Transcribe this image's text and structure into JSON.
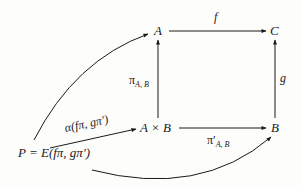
{
  "nodes": {
    "A": "A",
    "C": "C",
    "AxB": "A × B",
    "B": "B",
    "P": "P = E(fπ, gπ′)"
  },
  "arrows": {
    "f": "f",
    "g": "g",
    "pi_AB": "π",
    "pi_AB_sub": "A, B",
    "pi_prime_AB": "π′",
    "pi_prime_AB_sub": "A, B",
    "alpha": "α(fπ, gπ′)"
  },
  "colors": {
    "ink": "#1a1a1a",
    "background": "#fdfdfc"
  }
}
